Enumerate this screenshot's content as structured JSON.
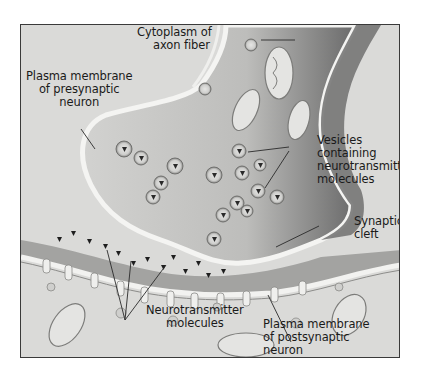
{
  "diagram": {
    "labels": {
      "cytoplasm": {
        "line1": "Cytoplasm of",
        "line2": "axon fiber"
      },
      "presynaptic_membrane": {
        "line1": "Plasma membrane",
        "line2": "of presynaptic",
        "line3": "neuron"
      },
      "vesicles": {
        "line1": "Vesicles",
        "line2": "containing",
        "line3": "neurotransmitter",
        "line4": "molecules"
      },
      "synaptic_cleft": {
        "line1": "Synaptic",
        "line2": "cleft"
      },
      "neurotransmitters": {
        "line1": "Neurotransmitter",
        "line2": "molecules"
      },
      "postsynaptic_membrane": {
        "line1": "Plasma membrane",
        "line2": "of postsynaptic",
        "line3": "neuron"
      }
    },
    "colors": {
      "background": "#d9d9d7",
      "axon_fill": "#c9c9c7",
      "axon_shadow": "#6e6e6e",
      "cleft": "#9a9a98",
      "membrane": "#efefed",
      "frame_border": "#3a3a3a",
      "text": "#1a1a1a"
    }
  }
}
